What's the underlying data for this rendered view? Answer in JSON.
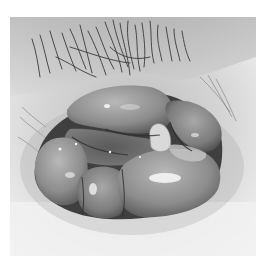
{
  "image": {
    "description": "Grayscale clinical photograph of a rounded mass of folded, glistening tissue lobes surrounded by skin with dark hair at the top",
    "color_mode": "grayscale",
    "colors": {
      "background": "#ffffff",
      "skin_light": "#e9e9e9",
      "skin_mid": "#cfcfcf",
      "hair": "#3a3a3a",
      "tissue_dark": "#4a4a4a",
      "tissue_mid": "#8a8a8a",
      "tissue_light": "#b5b5b5",
      "highlight": "#f4f4f4"
    }
  }
}
